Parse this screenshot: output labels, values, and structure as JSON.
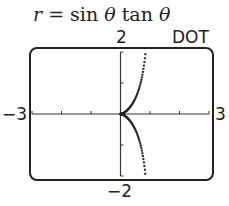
{
  "title": {
    "r": "r",
    "eq": " = sin ",
    "theta1": "θ",
    "tan": " tan ",
    "theta2": "θ"
  },
  "labels": {
    "ymax": "2",
    "ymin": "−2",
    "xmin": "−3",
    "xmax": "3",
    "mode": "DOT"
  },
  "chart_data": {
    "type": "scatter",
    "title": "r = sin θ tan θ",
    "mode": "DOT",
    "equation": "r = sin(theta) * tan(theta) (polar)",
    "xlim": [
      -3,
      3
    ],
    "ylim": [
      -2,
      2
    ],
    "x_ticks": [
      -3,
      -2,
      -1,
      0,
      1,
      2,
      3
    ],
    "y_ticks": [
      -2,
      -1,
      0,
      1,
      2
    ],
    "x_tick_labels": [
      "−3",
      "3"
    ],
    "y_tick_labels": [
      "−2",
      "2"
    ],
    "grid": false,
    "series": [
      {
        "name": "r = sin θ tan θ",
        "x": [
          0,
          0.05,
          0.1,
          0.2,
          0.3,
          0.4,
          0.5,
          0.6,
          0.7,
          0.75,
          0.8,
          0.83
        ],
        "y_upper": [
          0,
          0.011,
          0.033,
          0.1,
          0.196,
          0.327,
          0.5,
          0.735,
          1.069,
          1.299,
          1.6,
          1.86
        ],
        "y_lower": [
          0,
          -0.011,
          -0.033,
          -0.1,
          -0.196,
          -0.327,
          -0.5,
          -0.735,
          -1.069,
          -1.299,
          -1.6,
          -1.86
        ]
      }
    ]
  }
}
